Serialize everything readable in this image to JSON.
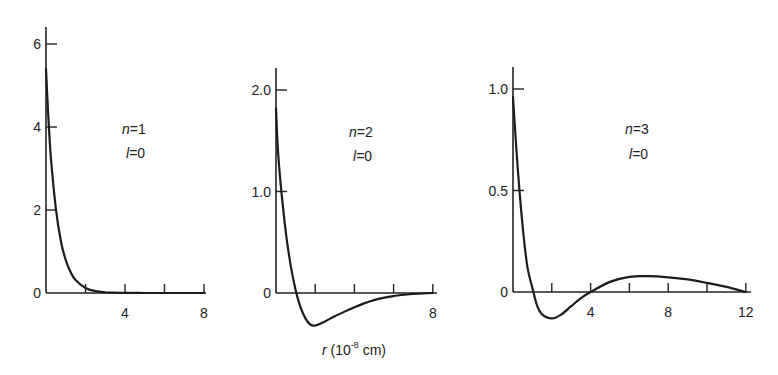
{
  "figure": {
    "shared_xlabel": "r (10⁻⁸ cm)",
    "xlabel_main": "r",
    "xlabel_unit_pre": " (10",
    "xlabel_exp": "-8",
    "xlabel_unit_post": " cm)"
  },
  "chart_data": [
    {
      "type": "line",
      "title": "n=1, l=0",
      "labels": {
        "n": "n=1",
        "l": "l=0"
      },
      "xlabel": "r (10^-8 cm)",
      "ylabel": "",
      "xlim": [
        0,
        8
      ],
      "ylim": [
        0,
        6
      ],
      "x_ticks": [
        2,
        4,
        6,
        8
      ],
      "x_tick_labels": [
        "",
        "4",
        "",
        "8"
      ],
      "y_ticks": [
        0,
        2,
        4,
        6
      ],
      "y_tick_labels": [
        "0",
        "2",
        "4",
        "6"
      ],
      "grid": false,
      "x": [
        0,
        0.1,
        0.25,
        0.5,
        0.75,
        1.0,
        1.25,
        1.5,
        2.0,
        2.5,
        3.0,
        3.5,
        4.0,
        5.0,
        6.0,
        7.0,
        8.0
      ],
      "values": [
        5.4,
        4.4,
        3.25,
        2.03,
        1.26,
        0.79,
        0.5,
        0.31,
        0.12,
        0.046,
        0.018,
        0.007,
        0.003,
        0.0,
        0.0,
        0.0,
        0.0
      ]
    },
    {
      "type": "line",
      "title": "n=2, l=0",
      "labels": {
        "n": "n=2",
        "l": "l=0"
      },
      "xlabel": "r (10^-8 cm)",
      "ylabel": "",
      "xlim": [
        0,
        8
      ],
      "ylim": [
        -0.4,
        2.2
      ],
      "x_ticks": [
        2,
        4,
        6,
        8
      ],
      "x_tick_labels": [
        "",
        "",
        "",
        "8"
      ],
      "y_ticks": [
        0,
        1.0,
        2.0
      ],
      "y_tick_labels": [
        "0",
        "1.0",
        "2.0"
      ],
      "grid": false,
      "x": [
        0,
        0.1,
        0.25,
        0.5,
        0.75,
        1.0,
        1.25,
        1.5,
        1.75,
        2.0,
        2.5,
        3.0,
        4.0,
        5.0,
        6.0,
        7.0,
        8.0
      ],
      "values": [
        1.82,
        1.4,
        1.05,
        0.6,
        0.27,
        0.03,
        -0.14,
        -0.25,
        -0.31,
        -0.32,
        -0.28,
        -0.23,
        -0.14,
        -0.07,
        -0.03,
        -0.01,
        0.0
      ]
    },
    {
      "type": "line",
      "title": "n=3, l=0",
      "labels": {
        "n": "n=3",
        "l": "l=0"
      },
      "xlabel": "r (10^-8 cm)",
      "ylabel": "",
      "xlim": [
        0,
        12
      ],
      "ylim": [
        -0.15,
        1.1
      ],
      "x_ticks": [
        2,
        4,
        6,
        8,
        10,
        12
      ],
      "x_tick_labels": [
        "",
        "4",
        "",
        "8",
        "",
        "12"
      ],
      "y_ticks": [
        0,
        0.5,
        1.0
      ],
      "y_tick_labels": [
        "0",
        "0.5",
        "1.0"
      ],
      "grid": false,
      "x": [
        0,
        0.25,
        0.5,
        0.75,
        1.0,
        1.25,
        1.5,
        2.0,
        2.5,
        3.0,
        3.5,
        4.0,
        5.0,
        6.0,
        7.0,
        8.0,
        9.0,
        10.0,
        11.0,
        12.0
      ],
      "values": [
        0.96,
        0.6,
        0.32,
        0.12,
        0.02,
        -0.07,
        -0.11,
        -0.13,
        -0.11,
        -0.07,
        -0.03,
        0.0,
        0.05,
        0.075,
        0.078,
        0.072,
        0.062,
        0.045,
        0.025,
        0.0
      ]
    }
  ],
  "layout": {
    "panels": [
      {
        "ox": 46,
        "oy": 293,
        "x_px_per_unit": 19.75,
        "y_px_per_unit": 41.5,
        "y_top": 27,
        "x_end": 206,
        "label_x": 122,
        "label_n_y": 134,
        "label_l_y": 158
      },
      {
        "ox": 276,
        "oy": 293,
        "x_px_per_unit": 19.6,
        "y_px_per_unit": 101.5,
        "y_top": 68,
        "x_end": 437,
        "label_x": 349,
        "label_n_y": 137,
        "label_l_y": 161
      },
      {
        "ox": 513,
        "oy": 292,
        "x_px_per_unit": 19.4,
        "y_px_per_unit": 203,
        "y_top": 67,
        "x_end": 751,
        "label_x": 625,
        "label_n_y": 134,
        "label_l_y": 159
      }
    ]
  }
}
